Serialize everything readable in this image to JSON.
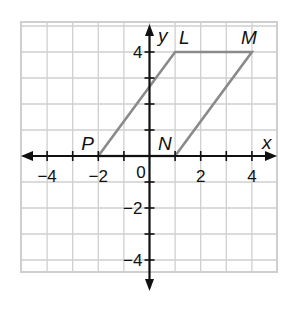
{
  "chart_data": {
    "type": "diagram",
    "title": "",
    "xlabel": "x",
    "ylabel": "y",
    "xlim": [
      -5,
      5
    ],
    "ylim": [
      -4.6,
      5.1
    ],
    "grid": true,
    "x_ticks": [
      {
        "value": -4,
        "label": "−4"
      },
      {
        "value": -2,
        "label": "−2"
      },
      {
        "value": 2,
        "label": "2"
      },
      {
        "value": 4,
        "label": "4"
      }
    ],
    "y_ticks": [
      {
        "value": 4,
        "label": "4"
      },
      {
        "value": -2,
        "label": "−2"
      },
      {
        "value": -4,
        "label": "−4"
      }
    ],
    "origin_label": "0",
    "points": [
      {
        "name": "P",
        "x": -2,
        "y": 0
      },
      {
        "name": "L",
        "x": 1,
        "y": 4
      },
      {
        "name": "M",
        "x": 4,
        "y": 4
      },
      {
        "name": "N",
        "x": 1,
        "y": 0
      }
    ],
    "polygon": {
      "name": "parallelogram PLMN",
      "vertices": [
        "P",
        "L",
        "M",
        "N"
      ],
      "stroke": "#8a8a8a"
    },
    "colors": {
      "grid": "#cfcfcf",
      "axis": "#111111",
      "shape": "#8a8a8a"
    }
  }
}
